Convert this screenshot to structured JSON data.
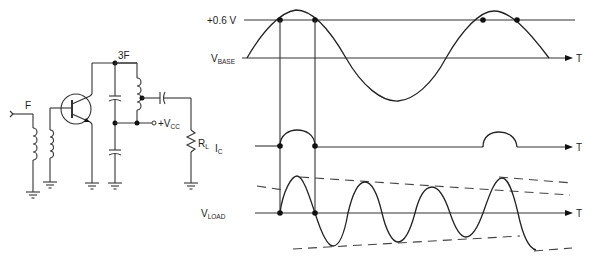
{
  "circuit": {
    "input_label": "F",
    "tank_label": "3F",
    "supply_label": "+V",
    "supply_sub": "CC",
    "load_label": "R",
    "load_sub": "L"
  },
  "waveforms": {
    "threshold_label": "+0.6 V",
    "base_label": "V",
    "base_sub": "BASE",
    "collector_label": "I",
    "collector_sub": "C",
    "load_label": "V",
    "load_sub": "LOAD",
    "time_axis_label": "T"
  }
}
